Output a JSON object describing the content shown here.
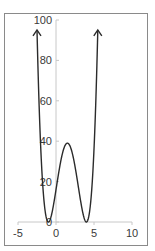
{
  "chart_data": {
    "type": "line",
    "title": "",
    "xlabel": "",
    "ylabel": "",
    "function": "y = (x+1)^2 (x-4)^2",
    "xlim": [
      -5,
      10
    ],
    "ylim": [
      0,
      100
    ],
    "x_ticks": [
      -5,
      0,
      5,
      10
    ],
    "y_ticks": [
      0,
      20,
      40,
      60,
      80,
      100
    ],
    "x_tick_labels": [
      "-5",
      "0",
      "5",
      "10"
    ],
    "y_tick_labels": [
      "0",
      "20",
      "40",
      "60",
      "80",
      "100"
    ],
    "grid": false,
    "legend": null,
    "series": [
      {
        "name": "curve",
        "x_range": [
          -2.5,
          5.5
        ],
        "points": [
          [
            -2.5,
            95.06
          ],
          [
            -2.25,
            76.7
          ],
          [
            -2.0,
            81.0
          ],
          [
            -1.75,
            42.0
          ],
          [
            -1.5,
            26.6
          ],
          [
            -1.25,
            13.9
          ],
          [
            -1.0,
            0.0
          ],
          [
            -0.5,
            4.6
          ],
          [
            0.0,
            16.0
          ],
          [
            0.5,
            28.9
          ],
          [
            1.0,
            36.0
          ],
          [
            1.5,
            39.06
          ],
          [
            2.0,
            36.0
          ],
          [
            2.5,
            28.9
          ],
          [
            3.0,
            16.0
          ],
          [
            3.5,
            4.6
          ],
          [
            4.0,
            0.0
          ],
          [
            4.5,
            7.6
          ],
          [
            5.0,
            36.0
          ],
          [
            5.5,
            95.06
          ]
        ],
        "annotations": [
          "arrow at left end (x=-2.5)",
          "arrow at right end (x=5.5)"
        ],
        "color": "#2b2b2b"
      }
    ],
    "local_max": {
      "x": 1.5,
      "y": 39.06
    },
    "roots": [
      -1,
      4
    ]
  },
  "colors": {
    "curve": "#2b2b2b",
    "axis": "#c8c8c8",
    "frame": "#8a8a8a",
    "label": "#3a3a3a"
  }
}
